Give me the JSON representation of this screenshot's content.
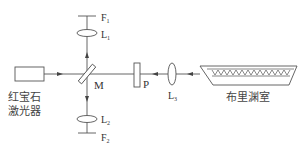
{
  "diagram": {
    "type": "optical-setup",
    "colors": {
      "line": "#555555",
      "text": "#333333",
      "background": "#ffffff"
    },
    "components": {
      "laser": {
        "label_line1": "红宝石",
        "label_line2": "激光器"
      },
      "mirror": {
        "label": "M"
      },
      "polarizer": {
        "label": "P"
      },
      "lens3": {
        "label": "L",
        "sub": "3"
      },
      "lens1": {
        "label": "L",
        "sub": "1"
      },
      "lens2": {
        "label": "L",
        "sub": "2"
      },
      "filter1": {
        "label": "F",
        "sub": "1"
      },
      "filter2": {
        "label": "F",
        "sub": "2"
      },
      "cell": {
        "label": "布里渊室"
      }
    }
  }
}
